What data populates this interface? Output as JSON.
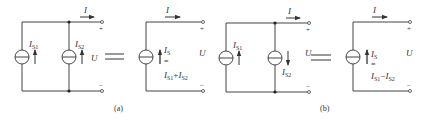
{
  "figure": {
    "labels": {
      "a": "(a)",
      "b": "(b)"
    },
    "colors": {
      "line": "#444444",
      "text": "#333333",
      "background": "#ffffff"
    }
  },
  "circuit_a_left": {
    "current": "I",
    "source1": {
      "name": "I",
      "sub": "S1",
      "direction": "up"
    },
    "source2": {
      "name": "I",
      "sub": "S2",
      "direction": "up"
    },
    "voltage": "U",
    "plus": "+",
    "minus": "−"
  },
  "equals_a": "=",
  "circuit_a_right": {
    "current": "I",
    "source": {
      "name": "I",
      "sub": "S",
      "direction": "up"
    },
    "eq": "=",
    "expr": {
      "t1": "I",
      "s1": "S1",
      "op": "+",
      "t2": "I",
      "s2": "S2"
    },
    "voltage": "U",
    "plus": "+",
    "minus": "−"
  },
  "circuit_b_left": {
    "current": "I",
    "source1": {
      "name": "I",
      "sub": "S1",
      "direction": "up"
    },
    "source2": {
      "name": "I",
      "sub": "S2",
      "direction": "down"
    },
    "voltage": "U",
    "plus": "+",
    "minus": "−"
  },
  "equals_b": "=",
  "circuit_b_right": {
    "current": "I",
    "source": {
      "name": "I",
      "sub": "S",
      "direction": "up"
    },
    "eq": "=",
    "expr": {
      "t1": "I",
      "s1": "S1",
      "op": "−",
      "t2": "I",
      "s2": "S2"
    },
    "voltage": "U",
    "plus": "+",
    "minus": "−"
  }
}
